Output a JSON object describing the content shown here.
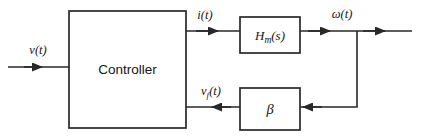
{
  "diagram": {
    "type": "control-system-block-diagram",
    "stroke_color": "#282828",
    "text_color": "#161616",
    "background_color": "#ffffff",
    "blocks": [
      {
        "id": "controller",
        "label": "Controller",
        "label_style": "sans-serif",
        "x": 69,
        "y": 11,
        "width": 117,
        "height": 117
      },
      {
        "id": "plant",
        "label_main": "H",
        "label_sub": "m",
        "label_tail": "(s)",
        "label_style": "italic-serif",
        "x": 240,
        "y": 17,
        "width": 60,
        "height": 36
      },
      {
        "id": "feedback-gain",
        "label": "β",
        "label_style": "italic-serif",
        "x": 240,
        "y": 88,
        "width": 60,
        "height": 42
      }
    ],
    "signals": [
      {
        "id": "input-signal",
        "label_main": "v",
        "label_sub": "",
        "label_tail": "(t)",
        "label_x": 38,
        "label_y": 54
      },
      {
        "id": "current-signal",
        "label_main": "i",
        "label_sub": "",
        "label_tail": "(t)",
        "label_x": 205,
        "label_y": 19
      },
      {
        "id": "speed-signal",
        "label_main": "ω",
        "label_sub": "",
        "label_tail": "(t)",
        "label_x": 342,
        "label_y": 18
      },
      {
        "id": "feedback-signal",
        "label_main": "v",
        "label_sub": "f",
        "label_tail": "(t)",
        "label_x": 200,
        "label_y": 95
      }
    ]
  }
}
